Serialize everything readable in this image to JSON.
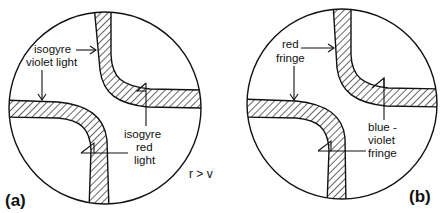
{
  "figure": {
    "relation": "r > v",
    "colors": {
      "ink": "#111111",
      "background": "#ffffff"
    }
  },
  "panels": [
    {
      "id": "a",
      "label": "(a)",
      "annotations": [
        {
          "lines": [
            "isogyre",
            "violet light"
          ]
        },
        {
          "lines": [
            "isogyre",
            "red",
            "light"
          ]
        }
      ]
    },
    {
      "id": "b",
      "label": "(b)",
      "annotations": [
        {
          "lines": [
            "red",
            "fringe"
          ]
        },
        {
          "lines": [
            "blue -",
            "violet",
            "fringe"
          ]
        }
      ]
    }
  ]
}
